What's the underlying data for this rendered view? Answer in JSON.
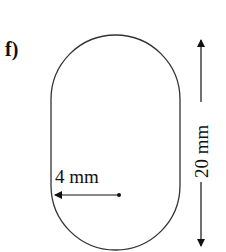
{
  "panel_label": "f)",
  "shape": "stadium (rounded rectangle with semicircular ends)",
  "radius_label": "4 mm",
  "height_label": "20 mm",
  "colors": {
    "stroke": "#333333",
    "text": "#111111",
    "background": "#ffffff"
  }
}
